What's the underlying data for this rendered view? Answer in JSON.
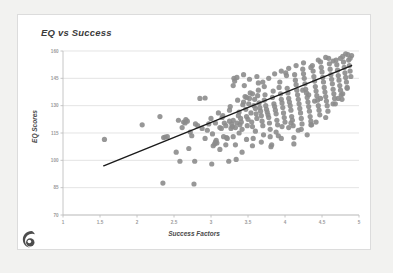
{
  "card": {
    "background": "#ffffff",
    "border_color": "#dcdcdc"
  },
  "page": {
    "background": "#f2f2f0"
  },
  "logo": {
    "name": "spiral-logo",
    "color": "#4d4d4d"
  },
  "chart_data": {
    "type": "scatter",
    "title": "EQ vs Success",
    "xlabel": "Success Factors",
    "ylabel": "EQ Scores",
    "xlim": [
      1,
      5
    ],
    "ylim": [
      70,
      160
    ],
    "xticks": [
      1,
      1.5,
      2,
      2.5,
      3,
      3.5,
      4,
      4.5,
      5
    ],
    "xtick_labels": [
      "1",
      "1.5",
      "2",
      "2.5",
      "3",
      "3.5",
      "4",
      "4.5",
      "5"
    ],
    "yticks": [
      70,
      85,
      100,
      115,
      130,
      145,
      160
    ],
    "ytick_labels": [
      "70",
      "85",
      "100",
      "115",
      "130",
      "145",
      "160"
    ],
    "grid": "horizontal",
    "grid_color": "#d9d9d9",
    "axis_color": "#bfbfbf",
    "legend": null,
    "marker": {
      "shape": "circle",
      "color": "#8c8c8c",
      "size": 2.6,
      "opacity": 0.9
    },
    "trendline": {
      "type": "linear",
      "color": "#1a1a1a",
      "width": 1.4,
      "x_start": 1.55,
      "y_start": 97.0,
      "x_end": 4.9,
      "y_end": 152.0,
      "slope": 16.4,
      "intercept": 71.6
    },
    "points": [
      [
        1.56,
        111.5
      ],
      [
        2.07,
        119.5
      ],
      [
        2.31,
        124.0
      ],
      [
        2.35,
        87.5
      ],
      [
        2.36,
        112.5
      ],
      [
        2.38,
        112.8
      ],
      [
        2.41,
        113.0
      ],
      [
        2.53,
        104.5
      ],
      [
        2.56,
        122.0
      ],
      [
        2.58,
        99.5
      ],
      [
        2.61,
        118.0
      ],
      [
        2.63,
        121.0
      ],
      [
        2.65,
        120.5
      ],
      [
        2.66,
        122.3
      ],
      [
        2.68,
        121.5
      ],
      [
        2.7,
        106.5
      ],
      [
        2.72,
        115.5
      ],
      [
        2.74,
        113.5
      ],
      [
        2.77,
        87.0
      ],
      [
        2.78,
        99.5
      ],
      [
        2.79,
        120.0
      ],
      [
        2.82,
        119.0
      ],
      [
        2.85,
        134.0
      ],
      [
        2.88,
        117.5
      ],
      [
        2.92,
        134.2
      ],
      [
        2.95,
        116.5
      ],
      [
        2.97,
        120.0
      ],
      [
        3.0,
        123.0
      ],
      [
        3.01,
        98.0
      ],
      [
        3.03,
        108.0
      ],
      [
        3.05,
        109.0
      ],
      [
        3.06,
        110.0
      ],
      [
        3.07,
        111.0
      ],
      [
        3.08,
        109.5
      ],
      [
        3.1,
        126.0
      ],
      [
        3.12,
        118.0
      ],
      [
        3.14,
        117.5
      ],
      [
        3.15,
        123.5
      ],
      [
        3.17,
        113.0
      ],
      [
        3.18,
        120.5
      ],
      [
        3.2,
        119.0
      ],
      [
        3.21,
        112.5
      ],
      [
        3.22,
        112.0
      ],
      [
        3.24,
        99.5
      ],
      [
        3.25,
        127.5
      ],
      [
        3.26,
        129.5
      ],
      [
        3.27,
        117.5
      ],
      [
        3.28,
        120.0
      ],
      [
        3.29,
        118.5
      ],
      [
        3.3,
        122.0
      ],
      [
        3.31,
        145.0
      ],
      [
        3.32,
        143.5
      ],
      [
        3.33,
        108.5
      ],
      [
        3.34,
        100.5
      ],
      [
        3.35,
        120.5
      ],
      [
        3.36,
        133.0
      ],
      [
        3.37,
        124.5
      ],
      [
        3.38,
        126.5
      ],
      [
        3.39,
        119.5
      ],
      [
        3.4,
        123.0
      ],
      [
        3.41,
        121.0
      ],
      [
        3.42,
        117.0
      ],
      [
        3.43,
        130.5
      ],
      [
        3.44,
        132.0
      ],
      [
        3.45,
        141.0
      ],
      [
        3.46,
        135.0
      ],
      [
        3.47,
        128.0
      ],
      [
        3.48,
        124.0
      ],
      [
        3.49,
        119.0
      ],
      [
        3.5,
        122.5
      ],
      [
        3.51,
        131.0
      ],
      [
        3.52,
        134.0
      ],
      [
        3.53,
        137.0
      ],
      [
        3.54,
        126.0
      ],
      [
        3.55,
        121.0
      ],
      [
        3.56,
        118.5
      ],
      [
        3.57,
        112.0
      ],
      [
        3.58,
        130.0
      ],
      [
        3.59,
        133.5
      ],
      [
        3.6,
        128.5
      ],
      [
        3.61,
        125.5
      ],
      [
        3.62,
        123.0
      ],
      [
        3.63,
        135.5
      ],
      [
        3.64,
        142.5
      ],
      [
        3.65,
        131.5
      ],
      [
        3.66,
        129.0
      ],
      [
        3.67,
        127.0
      ],
      [
        3.68,
        124.5
      ],
      [
        3.69,
        121.5
      ],
      [
        3.7,
        119.0
      ],
      [
        3.71,
        114.0
      ],
      [
        3.72,
        133.0
      ],
      [
        3.73,
        136.0
      ],
      [
        3.74,
        130.0
      ],
      [
        3.75,
        128.0
      ],
      [
        3.76,
        126.5
      ],
      [
        3.77,
        125.0
      ],
      [
        3.78,
        123.5
      ],
      [
        3.79,
        120.5
      ],
      [
        3.8,
        117.0
      ],
      [
        3.81,
        107.5
      ],
      [
        3.82,
        108.5
      ],
      [
        3.83,
        134.5
      ],
      [
        3.84,
        138.0
      ],
      [
        3.85,
        131.0
      ],
      [
        3.86,
        129.5
      ],
      [
        3.87,
        127.5
      ],
      [
        3.88,
        125.5
      ],
      [
        3.89,
        122.0
      ],
      [
        3.9,
        119.5
      ],
      [
        3.91,
        113.5
      ],
      [
        3.92,
        140.0
      ],
      [
        3.93,
        143.0
      ],
      [
        3.94,
        136.5
      ],
      [
        3.95,
        133.5
      ],
      [
        3.96,
        131.5
      ],
      [
        3.97,
        129.0
      ],
      [
        3.98,
        126.0
      ],
      [
        3.99,
        123.5
      ],
      [
        4.0,
        121.0
      ],
      [
        4.01,
        148.0
      ],
      [
        4.02,
        146.5
      ],
      [
        4.03,
        139.5
      ],
      [
        4.04,
        137.0
      ],
      [
        4.05,
        134.0
      ],
      [
        4.06,
        132.0
      ],
      [
        4.07,
        130.0
      ],
      [
        4.08,
        127.5
      ],
      [
        4.09,
        124.0
      ],
      [
        4.1,
        122.0
      ],
      [
        4.11,
        119.0
      ],
      [
        4.12,
        112.5
      ],
      [
        4.13,
        147.0
      ],
      [
        4.14,
        144.0
      ],
      [
        4.15,
        141.5
      ],
      [
        4.16,
        138.5
      ],
      [
        4.17,
        136.0
      ],
      [
        4.18,
        133.5
      ],
      [
        4.19,
        131.0
      ],
      [
        4.2,
        128.5
      ],
      [
        4.21,
        126.0
      ],
      [
        4.22,
        123.0
      ],
      [
        4.23,
        120.0
      ],
      [
        4.24,
        150.0
      ],
      [
        4.25,
        147.5
      ],
      [
        4.26,
        145.0
      ],
      [
        4.27,
        142.0
      ],
      [
        4.28,
        139.0
      ],
      [
        4.29,
        137.0
      ],
      [
        4.3,
        134.5
      ],
      [
        4.31,
        132.0
      ],
      [
        4.32,
        129.5
      ],
      [
        4.33,
        127.0
      ],
      [
        4.34,
        124.0
      ],
      [
        4.35,
        121.5
      ],
      [
        4.36,
        119.5
      ],
      [
        4.37,
        152.0
      ],
      [
        4.38,
        149.0
      ],
      [
        4.39,
        146.0
      ],
      [
        4.4,
        143.5
      ],
      [
        4.41,
        140.5
      ],
      [
        4.42,
        138.0
      ],
      [
        4.43,
        135.5
      ],
      [
        4.44,
        133.0
      ],
      [
        4.45,
        130.0
      ],
      [
        4.46,
        127.5
      ],
      [
        4.47,
        125.0
      ],
      [
        4.48,
        154.0
      ],
      [
        4.49,
        151.0
      ],
      [
        4.5,
        148.5
      ],
      [
        4.51,
        145.5
      ],
      [
        4.52,
        143.0
      ],
      [
        4.53,
        140.0
      ],
      [
        4.54,
        137.5
      ],
      [
        4.55,
        135.0
      ],
      [
        4.56,
        132.5
      ],
      [
        4.57,
        130.0
      ],
      [
        4.58,
        127.0
      ],
      [
        4.59,
        156.0
      ],
      [
        4.6,
        153.0
      ],
      [
        4.61,
        150.0
      ],
      [
        4.62,
        147.0
      ],
      [
        4.63,
        144.5
      ],
      [
        4.64,
        142.0
      ],
      [
        4.65,
        139.0
      ],
      [
        4.66,
        136.5
      ],
      [
        4.67,
        134.0
      ],
      [
        4.68,
        131.0
      ],
      [
        4.69,
        155.0
      ],
      [
        4.7,
        152.5
      ],
      [
        4.71,
        149.5
      ],
      [
        4.72,
        146.5
      ],
      [
        4.73,
        144.0
      ],
      [
        4.74,
        141.0
      ],
      [
        4.75,
        138.5
      ],
      [
        4.76,
        136.0
      ],
      [
        4.77,
        133.5
      ],
      [
        4.78,
        157.0
      ],
      [
        4.79,
        154.0
      ],
      [
        4.8,
        151.0
      ],
      [
        4.81,
        148.0
      ],
      [
        4.82,
        145.5
      ],
      [
        4.83,
        143.0
      ],
      [
        4.84,
        140.0
      ],
      [
        4.85,
        158.0
      ],
      [
        4.86,
        155.0
      ],
      [
        4.87,
        152.0
      ],
      [
        4.88,
        149.0
      ],
      [
        4.89,
        146.0
      ],
      [
        4.9,
        157.5
      ],
      [
        3.3,
        141.0
      ],
      [
        3.35,
        145.5
      ],
      [
        3.44,
        147.0
      ],
      [
        3.52,
        144.5
      ],
      [
        3.62,
        146.0
      ],
      [
        3.7,
        143.0
      ],
      [
        3.78,
        145.0
      ],
      [
        3.86,
        147.5
      ],
      [
        3.95,
        149.0
      ],
      [
        4.05,
        150.5
      ],
      [
        4.15,
        152.0
      ],
      [
        4.25,
        153.5
      ],
      [
        4.35,
        151.0
      ],
      [
        4.45,
        155.0
      ],
      [
        4.55,
        156.5
      ],
      [
        4.65,
        154.5
      ],
      [
        4.75,
        156.0
      ],
      [
        4.82,
        158.5
      ],
      [
        4.88,
        156.0
      ],
      [
        3.42,
        104.5
      ],
      [
        3.56,
        108.0
      ],
      [
        3.68,
        110.0
      ],
      [
        3.8,
        113.0
      ],
      [
        3.88,
        115.5
      ],
      [
        3.95,
        112.0
      ],
      [
        4.05,
        118.0
      ],
      [
        4.18,
        116.5
      ],
      [
        4.3,
        114.0
      ],
      [
        4.12,
        109.0
      ],
      [
        4.42,
        121.0
      ],
      [
        4.55,
        123.5
      ],
      [
        3.3,
        113.0
      ],
      [
        3.38,
        115.0
      ],
      [
        3.48,
        111.5
      ],
      [
        3.6,
        116.0
      ],
      [
        2.92,
        112.0
      ],
      [
        3.02,
        114.5
      ],
      [
        3.12,
        106.0
      ],
      [
        3.2,
        108.5
      ],
      [
        3.06,
        120.5
      ],
      [
        3.16,
        124.5
      ],
      [
        3.25,
        121.5
      ],
      [
        3.33,
        118.0
      ],
      [
        4.35,
        119.5
      ],
      [
        4.22,
        117.0
      ],
      [
        4.08,
        120.5
      ],
      [
        3.96,
        118.5
      ],
      [
        4.65,
        131.0
      ],
      [
        4.72,
        134.0
      ],
      [
        4.78,
        136.5
      ],
      [
        4.84,
        139.5
      ],
      [
        3.72,
        140.5
      ],
      [
        3.64,
        138.5
      ],
      [
        3.56,
        136.5
      ],
      [
        3.48,
        134.5
      ],
      [
        4.48,
        134.0
      ],
      [
        4.4,
        132.5
      ],
      [
        4.32,
        136.0
      ],
      [
        4.24,
        138.5
      ]
    ]
  }
}
